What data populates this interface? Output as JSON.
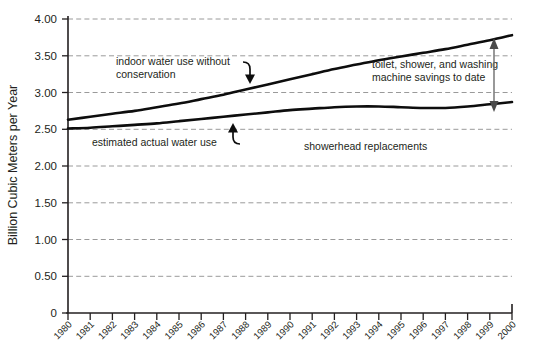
{
  "chart_data": {
    "type": "line",
    "title": "",
    "xlabel": "",
    "ylabel": "Billion Cubic Meters per Year",
    "ylim": [
      0,
      4.0
    ],
    "ytick_values": [
      0,
      0.5,
      1.0,
      1.5,
      2.0,
      2.5,
      3.0,
      3.5,
      4.0
    ],
    "ytick_labels": [
      "0",
      "0.50",
      "1.00",
      "1.50",
      "2.00",
      "2.50",
      "3.00",
      "3.50",
      "4.00"
    ],
    "grid": true,
    "legend_position": "inline-annotations",
    "categories": [
      "1980",
      "1981",
      "1982",
      "1983",
      "1984",
      "1985",
      "1986",
      "1987",
      "1988",
      "1989",
      "1990",
      "1991",
      "1992",
      "1993",
      "1994",
      "1995",
      "1996",
      "1997",
      "1998",
      "1999",
      "2000"
    ],
    "series": [
      {
        "name": "indoor water use without conservation",
        "values": [
          2.63,
          2.67,
          2.71,
          2.75,
          2.8,
          2.85,
          2.91,
          2.97,
          3.04,
          3.11,
          3.18,
          3.25,
          3.32,
          3.38,
          3.44,
          3.49,
          3.54,
          3.59,
          3.65,
          3.71,
          3.78
        ]
      },
      {
        "name": "estimated actual water use",
        "values": [
          2.51,
          2.52,
          2.54,
          2.56,
          2.58,
          2.61,
          2.64,
          2.67,
          2.7,
          2.73,
          2.76,
          2.78,
          2.8,
          2.81,
          2.81,
          2.8,
          2.79,
          2.79,
          2.81,
          2.84,
          2.87
        ]
      }
    ],
    "annotations": [
      {
        "name": "upper-series-callout",
        "text_line1": "indoor water use without",
        "text_line2": "conservation"
      },
      {
        "name": "lower-series-callout",
        "text": "estimated actual water use"
      },
      {
        "name": "gap-callout",
        "text_line1": "toilet, shower, and washing",
        "text_line2": "machine savings to date"
      },
      {
        "name": "showerhead-callout",
        "text": "showerhead replacements"
      }
    ],
    "colors": {
      "line": "#0d0d0d",
      "grid": "#9a9a9a",
      "axis": "#231f20",
      "text": "#231f20",
      "measure_arrow": "#6d6d6d",
      "background": "#ffffff"
    }
  }
}
